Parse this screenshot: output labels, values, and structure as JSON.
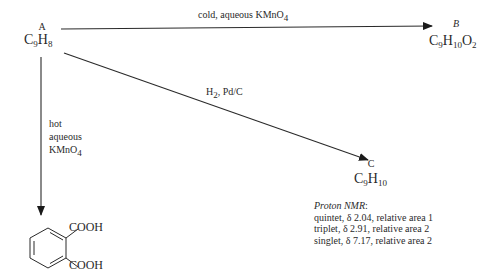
{
  "compounds": {
    "A": {
      "letter": "A",
      "formula_base": "C",
      "sub1": "9",
      "el2": "H",
      "sub2": "8"
    },
    "B": {
      "letter": "B",
      "formula_base": "C",
      "sub1": "9",
      "el2": "H",
      "sub2": "10",
      "el3": "O",
      "sub3": "2"
    },
    "C": {
      "letter": "C",
      "formula_base": "C",
      "sub1": "9",
      "el2": "H",
      "sub2": "10"
    },
    "product": {
      "group1": "COOH",
      "group2": "COOH"
    }
  },
  "reactions": {
    "a_to_b": {
      "reagent": "cold, aqueous KMnO",
      "reagent_sub": "4"
    },
    "a_to_c": {
      "reagent_h": "H",
      "reagent_h_sub": "2",
      "reagent_rest": ", Pd/C"
    },
    "a_to_product": {
      "line1": "hot",
      "line2": "aqueous",
      "line3": "KMnO",
      "line3_sub": "4"
    }
  },
  "nmr": {
    "title": "Proton NMR",
    "title_suffix": ":",
    "signals": [
      "quintet, δ 2.04, relative area 1",
      "triplet, δ 2.91, relative area 2",
      "singlet, δ 7.17, relative area 2"
    ]
  },
  "colors": {
    "line": "#2a2a2a",
    "text": "#2a2a2a"
  }
}
